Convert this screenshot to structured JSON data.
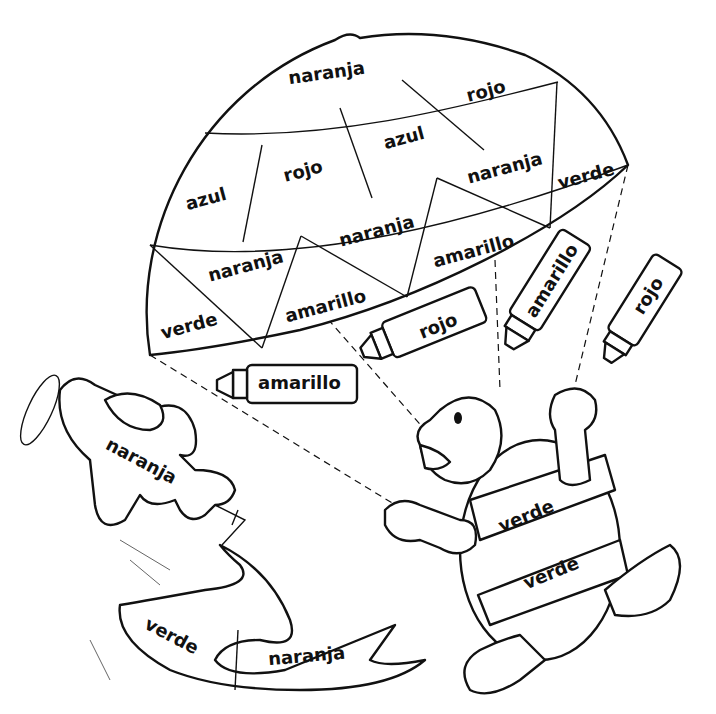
{
  "page": {
    "type": "color-by-word coloring page",
    "background": "#ffffff",
    "line_color": "#111111"
  },
  "parachute": {
    "sections": [
      {
        "label": "naranja"
      },
      {
        "label": "rojo"
      },
      {
        "label": "azul"
      },
      {
        "label": "rojo"
      },
      {
        "label": "azul"
      },
      {
        "label": "naranja"
      },
      {
        "label": "verde"
      },
      {
        "label": "naranja"
      },
      {
        "label": "naranja"
      },
      {
        "label": "amarillo"
      },
      {
        "label": "verde"
      },
      {
        "label": "amarillo"
      }
    ]
  },
  "crayons": [
    {
      "label": "amarillo"
    },
    {
      "label": "rojo"
    },
    {
      "label": "amarillo"
    },
    {
      "label": "rojo"
    }
  ],
  "airplane": {
    "label": "naranja"
  },
  "banner": {
    "left_label": "verde",
    "right_label": "naranja"
  },
  "turtle": {
    "shell_top_label": "verde",
    "shell_bottom_label": "verde"
  }
}
